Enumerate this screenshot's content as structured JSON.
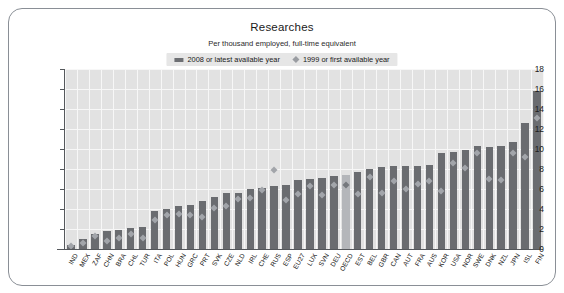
{
  "chart_data": {
    "type": "bar",
    "title": "Researches",
    "subtitle": "Per thousand employed, full-time equivalent",
    "xlabel": "",
    "ylabel": "",
    "ylim": [
      0,
      18
    ],
    "yticks": [
      0,
      2,
      4,
      6,
      8,
      10,
      12,
      14,
      16,
      18
    ],
    "grid": true,
    "legend_position": "top-center",
    "legend": [
      {
        "label": "2008 or latest available year",
        "marker": "bar",
        "color": "#6a6c70"
      },
      {
        "label": "1999 or first available year",
        "marker": "diamond",
        "color": "#a2a5aa"
      }
    ],
    "highlight_category": "OECD",
    "categories": [
      "IND",
      "MEX",
      "ZAF",
      "CHN",
      "BRA",
      "CHL",
      "TUR",
      "ITA",
      "POL",
      "HUN",
      "GRC",
      "PRT",
      "SVK",
      "CZE",
      "NLD",
      "IRL",
      "CHE",
      "RUS",
      "ESP",
      "EU27",
      "LUX",
      "SVN",
      "DEU",
      "OECD",
      "EST",
      "BEL",
      "GBR",
      "CAN",
      "AUT",
      "FRA",
      "AUS",
      "KOR",
      "USA",
      "NOR",
      "SWE",
      "DNK",
      "NZL",
      "JPN",
      "ISL",
      "FIN"
    ],
    "series": [
      {
        "name": "2008 or latest available year",
        "values": [
          0.4,
          1.0,
          1.5,
          1.8,
          1.9,
          2.1,
          2.2,
          3.8,
          4.0,
          4.3,
          4.4,
          4.8,
          5.2,
          5.6,
          5.6,
          6.0,
          6.1,
          6.3,
          6.4,
          6.9,
          7.0,
          7.1,
          7.3,
          7.4,
          7.7,
          8.0,
          8.2,
          8.3,
          8.3,
          8.3,
          8.4,
          9.6,
          9.7,
          9.9,
          10.3,
          10.2,
          10.3,
          10.7,
          12.6,
          15.8
        ]
      },
      {
        "name": "1999 or first available year",
        "values": [
          0.3,
          0.6,
          1.3,
          0.8,
          1.1,
          1.5,
          1.1,
          2.9,
          3.4,
          3.5,
          3.4,
          3.2,
          4.1,
          4.3,
          5.0,
          5.1,
          5.9,
          7.9,
          4.9,
          5.5,
          6.3,
          5.4,
          6.4,
          6.4,
          5.5,
          7.2,
          5.6,
          6.8,
          6.0,
          6.5,
          6.8,
          5.8,
          8.6,
          8.1,
          9.6,
          7.0,
          6.9,
          9.6,
          9.2,
          13.1
        ]
      }
    ]
  }
}
